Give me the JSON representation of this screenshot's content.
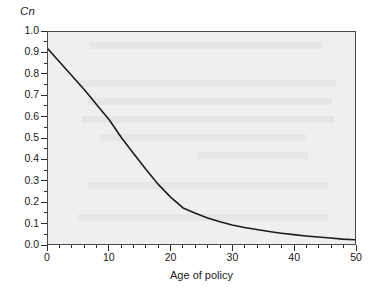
{
  "chart_data": {
    "type": "line",
    "title": "",
    "subtitle": "",
    "xlabel": "Age of policy",
    "ylabel": "Cn",
    "xlim": [
      0,
      50
    ],
    "ylim": [
      0.0,
      1.0
    ],
    "grid": false,
    "legend": null,
    "legend_position": "none",
    "x_major_ticks": [
      0,
      10,
      20,
      30,
      40,
      50
    ],
    "x_major_tick_labels": [
      "0",
      "10",
      "20",
      "30",
      "40",
      "50"
    ],
    "x_minor_tick_step": 2,
    "y_major_ticks": [
      0.0,
      0.1,
      0.2,
      0.3,
      0.4,
      0.5,
      0.6,
      0.7,
      0.8,
      0.9,
      1.0
    ],
    "y_major_tick_labels": [
      "0.0",
      "0.1",
      "0.2",
      "0.3",
      "0.4",
      "0.5",
      "0.6",
      "0.7",
      "0.8",
      "0.9",
      "1.0"
    ],
    "y_minor_tick_step": 0.05,
    "series": [
      {
        "name": "Cn",
        "color": "#1c1c1c",
        "line_width": 1.6,
        "x": [
          0,
          2,
          4,
          6,
          8,
          10,
          12,
          14,
          16,
          18,
          20,
          22,
          24,
          26,
          28,
          30,
          32,
          34,
          36,
          38,
          40,
          42,
          44,
          46,
          48,
          50
        ],
        "values": [
          0.92,
          0.855,
          0.79,
          0.725,
          0.655,
          0.585,
          0.5,
          0.425,
          0.35,
          0.28,
          0.22,
          0.17,
          0.145,
          0.123,
          0.105,
          0.09,
          0.078,
          0.068,
          0.059,
          0.051,
          0.044,
          0.038,
          0.033,
          0.028,
          0.023,
          0.02
        ]
      }
    ],
    "annotations": [],
    "plot_background": "#eef0ef",
    "figure_background": "#ffffff",
    "frame_color": "#4a4a4a"
  },
  "axes": {
    "y_title": "Cn",
    "x_title": "Age of policy"
  }
}
